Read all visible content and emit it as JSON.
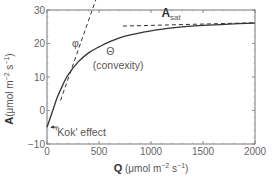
{
  "chart_data": {
    "type": "line",
    "title": "",
    "xlabel": "Q (μmol m⁻² s⁻¹)",
    "xlabel_parts": {
      "bold": "Q",
      "rest": " (μmol m",
      "sup1": "−2",
      "mid": " s",
      "sup2": "−1",
      "end": ")"
    },
    "ylabel": "A(μmol m⁻² s⁻¹)",
    "ylabel_parts": {
      "bold": "A",
      "rest": "(μmol m",
      "sup1": "−2",
      "mid": " s",
      "sup2": "−1",
      "end": ")"
    },
    "xlim": [
      0,
      2000
    ],
    "ylim": [
      -10,
      30
    ],
    "x_ticks": [
      0,
      500,
      1000,
      1500,
      2000
    ],
    "y_ticks": [
      -10,
      0,
      10,
      20,
      30
    ],
    "x_tick_labels": [
      "0",
      "500",
      "1000",
      "1500",
      "2000"
    ],
    "y_tick_labels": [
      "−10",
      "0",
      "10",
      "20",
      "30"
    ],
    "grid": false,
    "legend": null,
    "series": [
      {
        "name": "Light response curve",
        "style": "solid",
        "x": [
          0,
          50,
          100,
          150,
          200,
          300,
          400,
          500,
          600,
          750,
          1000,
          1250,
          1500,
          1750,
          2000
        ],
        "values": [
          -5,
          -0.5,
          4,
          7.5,
          10.5,
          14.5,
          17.2,
          19,
          20.5,
          22.2,
          23.8,
          24.8,
          25.4,
          25.8,
          26.1
        ]
      },
      {
        "name": "Initial slope (φ)",
        "style": "dashed",
        "x": [
          130,
          480
        ],
        "values": [
          3.0,
          34.0
        ]
      },
      {
        "name": "A_sat asymptote",
        "style": "dashed",
        "x": [
          730,
          2000
        ],
        "values": [
          25.2,
          26.2
        ]
      }
    ],
    "annotations": [
      {
        "text": "φ",
        "x": 240,
        "y": 19
      },
      {
        "text": "Θ",
        "x": 570,
        "y": 16.5
      },
      {
        "text": "(convexity)",
        "x": 440,
        "y": 12.5
      },
      {
        "text": "A",
        "subscript": "sat",
        "x": 1100,
        "y": 28
      },
      {
        "text": "'Kok' effect",
        "x": 80,
        "y": -7.5,
        "arrow": "left"
      }
    ]
  }
}
